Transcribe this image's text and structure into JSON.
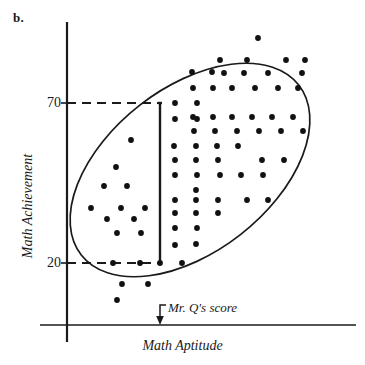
{
  "figure": {
    "panel_label": "b."
  },
  "chart_data": {
    "type": "scatter",
    "title": "",
    "xlabel": "Math Aptitude",
    "ylabel": "Math Achievement",
    "grid": false,
    "legend": null,
    "xlim": [
      0,
      100
    ],
    "ylim": [
      0,
      100
    ],
    "y_ticks": [
      {
        "label": "70",
        "value": 70
      },
      {
        "label": "20",
        "value": 20
      }
    ],
    "x_ticks": [],
    "annotations": [
      {
        "name": "mr-q-score",
        "text": "Mr. Q's score",
        "type": "arrow-label",
        "points_to_axis": "x"
      }
    ],
    "reference_lines": [
      {
        "name": "achievement-70",
        "orientation": "horizontal",
        "value": 70,
        "style": "dashed"
      },
      {
        "name": "achievement-20",
        "orientation": "horizontal",
        "value": 20,
        "style": "dashed"
      },
      {
        "name": "mr-q-score-line",
        "orientation": "vertical",
        "style": "solid",
        "from": 20,
        "to": 70
      }
    ],
    "envelope": {
      "name": "correlation-ellipse",
      "shape": "ellipse",
      "rotation_deg": -38,
      "description": "tilted ellipse enclosing the scatter cloud indicating positive correlation"
    },
    "points": [
      [
        258,
        38
      ],
      [
        220,
        60
      ],
      [
        247,
        60
      ],
      [
        286,
        60
      ],
      [
        305,
        60
      ],
      [
        224,
        73
      ],
      [
        244,
        73
      ],
      [
        268,
        73
      ],
      [
        302,
        73
      ],
      [
        192,
        72
      ],
      [
        212,
        72
      ],
      [
        193,
        88
      ],
      [
        213,
        88
      ],
      [
        232,
        88
      ],
      [
        255,
        88
      ],
      [
        278,
        88
      ],
      [
        298,
        88
      ],
      [
        175,
        103
      ],
      [
        197,
        103
      ],
      [
        193,
        117
      ],
      [
        213,
        117
      ],
      [
        232,
        117
      ],
      [
        252,
        117
      ],
      [
        272,
        117
      ],
      [
        293,
        117
      ],
      [
        175,
        119
      ],
      [
        197,
        119
      ],
      [
        194,
        131
      ],
      [
        215,
        131
      ],
      [
        237,
        131
      ],
      [
        259,
        131
      ],
      [
        281,
        131
      ],
      [
        303,
        131
      ],
      [
        131,
        140
      ],
      [
        174,
        146
      ],
      [
        196,
        146
      ],
      [
        217,
        146
      ],
      [
        238,
        146
      ],
      [
        175,
        160
      ],
      [
        196,
        160
      ],
      [
        218,
        160
      ],
      [
        262,
        160
      ],
      [
        284,
        160
      ],
      [
        116,
        167
      ],
      [
        175,
        175
      ],
      [
        197,
        175
      ],
      [
        220,
        175
      ],
      [
        241,
        175
      ],
      [
        263,
        175
      ],
      [
        104,
        186
      ],
      [
        127,
        186
      ],
      [
        196,
        190
      ],
      [
        175,
        200
      ],
      [
        196,
        200
      ],
      [
        218,
        200
      ],
      [
        247,
        200
      ],
      [
        268,
        200
      ],
      [
        91,
        208
      ],
      [
        121,
        208
      ],
      [
        145,
        208
      ],
      [
        175,
        213
      ],
      [
        196,
        213
      ],
      [
        218,
        213
      ],
      [
        107,
        219
      ],
      [
        134,
        219
      ],
      [
        175,
        228
      ],
      [
        197,
        228
      ],
      [
        117,
        233
      ],
      [
        141,
        233
      ],
      [
        196,
        244
      ],
      [
        175,
        245
      ],
      [
        113,
        263
      ],
      [
        140,
        263
      ],
      [
        160,
        263
      ],
      [
        182,
        263
      ],
      [
        122,
        284
      ],
      [
        148,
        284
      ],
      [
        117,
        300
      ]
    ],
    "point_count": 78
  }
}
